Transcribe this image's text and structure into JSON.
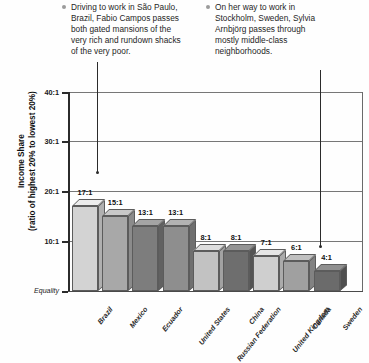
{
  "annotations": [
    {
      "id": "callout-left",
      "name": "annotation-brazil",
      "text": "Driving to work in São Paulo, Brazil, Fabio Campos passes both gated mansions of the very rich and rundown shacks of the very poor.",
      "bullet": "bullet-dot",
      "leader": {
        "x": 97,
        "top": 62,
        "bottom": 172
      }
    },
    {
      "id": "callout-right",
      "name": "annotation-sweden",
      "text": "On her way to work in Stockholm, Sweden, Sylvia Arnbjörg passes through mostly middle-class neighborhoods.",
      "bullet": "bullet-dot",
      "leader": {
        "x": 320,
        "top": 70,
        "bottom": 246
      }
    }
  ],
  "chart_data": {
    "type": "bar",
    "title": "",
    "xlabel": "",
    "ylabel": "Income Share\n(ratio of highest 20% to lowest 20%)",
    "ylabel_line1": "Income Share",
    "ylabel_line2": "(ratio of highest 20% to lowest 20%)",
    "ylim": [
      0,
      40
    ],
    "yticks": [
      40,
      30,
      20,
      10,
      0
    ],
    "ytick_labels": [
      "40:1",
      "30:1",
      "20:1",
      "10:1",
      "Equality"
    ],
    "grid": true,
    "grid_axis": "y",
    "legend": "none",
    "categories": [
      "Brazil",
      "Mexico",
      "Ecuador",
      "United States",
      "Russian Federation",
      "China",
      "United Kingdom",
      "Canada",
      "Sweden"
    ],
    "values": [
      17,
      15,
      13,
      13,
      8,
      8,
      7,
      6,
      4
    ],
    "data_labels": [
      "17:1",
      "15:1",
      "13:1",
      "13:1",
      "8:1",
      "8:1",
      "7:1",
      "6:1",
      "4:1"
    ],
    "bar_colors": [
      "#d3d3d3",
      "#a8a8a8",
      "#7d7d7d",
      "#8e8e8e",
      "#c2c2c2",
      "#6e6e6e",
      "#cfcfcf",
      "#a0a0a0",
      "#6b6b6b"
    ],
    "bar_top_colors": [
      "#ececec",
      "#c9c9c9",
      "#a4a4a4",
      "#b2b2b2",
      "#dedede",
      "#949494",
      "#e6e6e6",
      "#c0c0c0",
      "#8f8f8f"
    ],
    "bar_side_colors": [
      "#b0b0b0",
      "#8b8b8b",
      "#616161",
      "#6f6f6f",
      "#a2a2a2",
      "#545454",
      "#ababab",
      "#828282",
      "#4f4f4f"
    ]
  }
}
